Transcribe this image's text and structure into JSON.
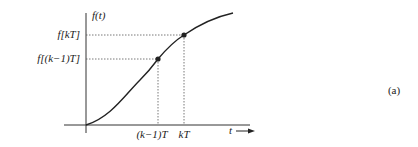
{
  "figure": {
    "y_axis_label": "f(t)",
    "x_axis_label": "t",
    "y_ticks": [
      {
        "label": "f[kT]"
      },
      {
        "label": "f[(k−1)T]"
      }
    ],
    "x_ticks": [
      {
        "label": "(k−1)T"
      },
      {
        "label": "kT"
      }
    ],
    "panel_label": "(a)",
    "colors": {
      "line": "#222222",
      "guide": "#555555"
    }
  }
}
